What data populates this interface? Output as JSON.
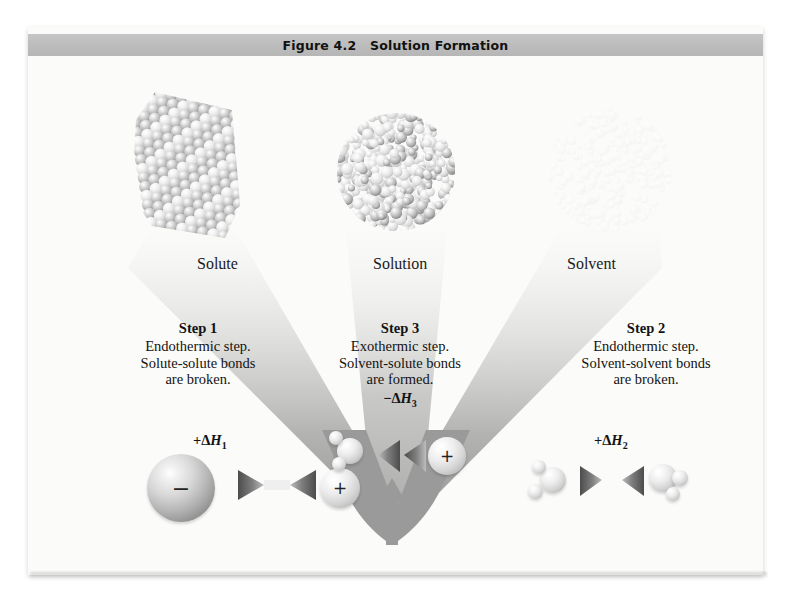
{
  "figure": {
    "title": "Figure 4.2   Solution Formation",
    "title_bar_color": "#bdbdbd",
    "plate_color": "#fbfbf9",
    "funnel_color": "#9a9a9a"
  },
  "illustrations": {
    "solute": {
      "label": "Solute",
      "description": "crystal-lattice-of-packed-spheres"
    },
    "solution": {
      "label": "Solution",
      "description": "round-droplet-of-mixed-particles"
    },
    "solvent": {
      "label": "Solvent",
      "description": "diffuse-cloud-of-particles"
    }
  },
  "steps": [
    {
      "id": "step1",
      "heading": "Step 1",
      "lines": [
        "Endothermic step.",
        "Solute-solute bonds",
        "are broken."
      ],
      "enthalpy": {
        "sign": "+",
        "delta": "Δ",
        "symbol": "H",
        "subscript": "1"
      }
    },
    {
      "id": "step3",
      "heading": "Step 3",
      "lines": [
        "Exothermic step.",
        "Solvent-solute bonds",
        "are formed."
      ],
      "enthalpy": {
        "sign": "−",
        "delta": "Δ",
        "symbol": "H",
        "subscript": "3"
      }
    },
    {
      "id": "step2",
      "heading": "Step 2",
      "lines": [
        "Endothermic step.",
        "Solvent-solvent bonds",
        "are broken."
      ],
      "enthalpy": {
        "sign": "+",
        "delta": "Δ",
        "symbol": "H",
        "subscript": "2"
      }
    }
  ],
  "molecule_rows": {
    "left": {
      "name": "ion-pair-separating",
      "particles": [
        "anion-sphere",
        "cation-sphere"
      ],
      "anion_charge": "−",
      "cation_charge": "+",
      "arrow": "double-arrow-outward"
    },
    "center": {
      "name": "water-ion-attraction",
      "particles": [
        "water-molecule",
        "cation-sphere"
      ],
      "cation_charge": "+",
      "arrow": "double-arrow-inward"
    },
    "right": {
      "name": "water-water-separating",
      "particles": [
        "water-molecule",
        "water-molecule"
      ],
      "arrow": "double-arrow-outward"
    }
  }
}
